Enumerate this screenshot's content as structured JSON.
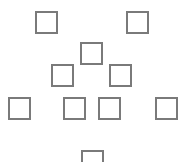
{
  "diagram": {
    "type": "scattered-empty-boxes",
    "border_color": "#7a7a7a",
    "background": "#ffffff",
    "boxes": [
      {
        "id": "box-1",
        "x": 35,
        "y": 11,
        "w": 23,
        "h": 23
      },
      {
        "id": "box-2",
        "x": 126,
        "y": 11,
        "w": 23,
        "h": 23
      },
      {
        "id": "box-3",
        "x": 80,
        "y": 42,
        "w": 23,
        "h": 23
      },
      {
        "id": "box-4",
        "x": 51,
        "y": 64,
        "w": 23,
        "h": 23
      },
      {
        "id": "box-5",
        "x": 109,
        "y": 64,
        "w": 23,
        "h": 23
      },
      {
        "id": "box-6",
        "x": 8,
        "y": 97,
        "w": 23,
        "h": 23
      },
      {
        "id": "box-7",
        "x": 63,
        "y": 97,
        "w": 23,
        "h": 23
      },
      {
        "id": "box-8",
        "x": 98,
        "y": 97,
        "w": 23,
        "h": 23
      },
      {
        "id": "box-9",
        "x": 155,
        "y": 97,
        "w": 23,
        "h": 23
      },
      {
        "id": "box-10",
        "x": 81,
        "y": 150,
        "w": 23,
        "h": 23
      }
    ]
  }
}
